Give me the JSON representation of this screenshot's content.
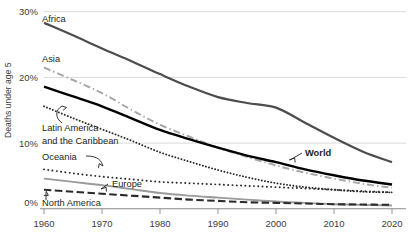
{
  "chart_data": {
    "type": "line",
    "title": "",
    "subtitle": "",
    "xlabel": "",
    "ylabel": "Deaths under age 5",
    "xlim": [
      1960,
      2020
    ],
    "ylim": [
      0,
      30
    ],
    "grid": true,
    "legend_position": "inline-labels",
    "x_ticks": [
      "1960",
      "1970",
      "1980",
      "1990",
      "2000",
      "2010",
      "2020"
    ],
    "y_ticks": [
      "0%",
      "10%",
      "20%",
      "30%"
    ],
    "x": [
      1960,
      1965,
      1970,
      1975,
      1980,
      1985,
      1990,
      1995,
      2000,
      2005,
      2010,
      2015,
      2020
    ],
    "series": [
      {
        "name": "Africa",
        "style": "solid",
        "color": "#4d4d4d",
        "width": 2.2,
        "values": [
          28.3,
          26.4,
          24.4,
          22.5,
          20.5,
          18.6,
          17.0,
          16.1,
          15.4,
          13.1,
          10.8,
          8.7,
          7.1
        ]
      },
      {
        "name": "Asia",
        "style": "dashdot",
        "color": "#a8a8a8",
        "width": 2.0,
        "values": [
          21.5,
          19.6,
          17.6,
          15.1,
          12.8,
          11.0,
          9.3,
          7.9,
          6.6,
          5.5,
          4.6,
          3.8,
          3.2
        ]
      },
      {
        "name": "World",
        "style": "solid",
        "color": "#000000",
        "width": 2.4,
        "values": [
          18.6,
          17.1,
          15.6,
          13.8,
          12.0,
          10.6,
          9.3,
          8.1,
          7.1,
          6.0,
          5.1,
          4.3,
          3.7
        ]
      },
      {
        "name": "Latin America and the Caribbean",
        "style": "dotted",
        "color": "#2b2b2b",
        "width": 1.9,
        "values": [
          15.6,
          13.8,
          12.1,
          10.4,
          8.6,
          7.2,
          5.9,
          4.8,
          3.9,
          3.3,
          2.9,
          2.6,
          2.5
        ]
      },
      {
        "name": "Oceania",
        "style": "dotted-sparse",
        "color": "#2b2b2b",
        "width": 1.9,
        "values": [
          6.0,
          5.4,
          4.9,
          4.5,
          4.1,
          3.9,
          3.7,
          3.5,
          3.3,
          3.1,
          2.9,
          2.7,
          2.5
        ]
      },
      {
        "name": "Europe",
        "style": "solid",
        "color": "#9a9a9a",
        "width": 1.9,
        "values": [
          4.6,
          4.1,
          3.6,
          3.0,
          2.4,
          2.0,
          1.7,
          1.4,
          1.1,
          0.9,
          0.7,
          0.6,
          0.5
        ]
      },
      {
        "name": "North America",
        "style": "dashed-long",
        "color": "#2b2b2b",
        "width": 2.1,
        "values": [
          2.9,
          2.6,
          2.3,
          2.0,
          1.7,
          1.4,
          1.2,
          1.0,
          0.9,
          0.8,
          0.7,
          0.65,
          0.6
        ]
      }
    ],
    "annotations": [
      {
        "name": "Africa",
        "text": "Africa",
        "x": 42,
        "y": 22,
        "bold": false
      },
      {
        "name": "Asia",
        "text": "Asia",
        "x": 42,
        "y": 62,
        "bold": false
      },
      {
        "name": "Latin America line 1",
        "text": "Latin America",
        "x": 42,
        "y": 131,
        "bold": false
      },
      {
        "name": "Latin America line 2",
        "text": "and the Caribbean",
        "x": 42,
        "y": 144,
        "bold": false
      },
      {
        "name": "Oceania",
        "text": "Oceania",
        "x": 42,
        "y": 160,
        "bold": false
      },
      {
        "name": "Europe",
        "text": "Europe",
        "x": 112,
        "y": 187,
        "bold": false
      },
      {
        "name": "North America",
        "text": "North America",
        "x": 42,
        "y": 206,
        "bold": false
      },
      {
        "name": "World",
        "text": "World",
        "x": 305,
        "y": 156,
        "bold": true
      }
    ]
  }
}
